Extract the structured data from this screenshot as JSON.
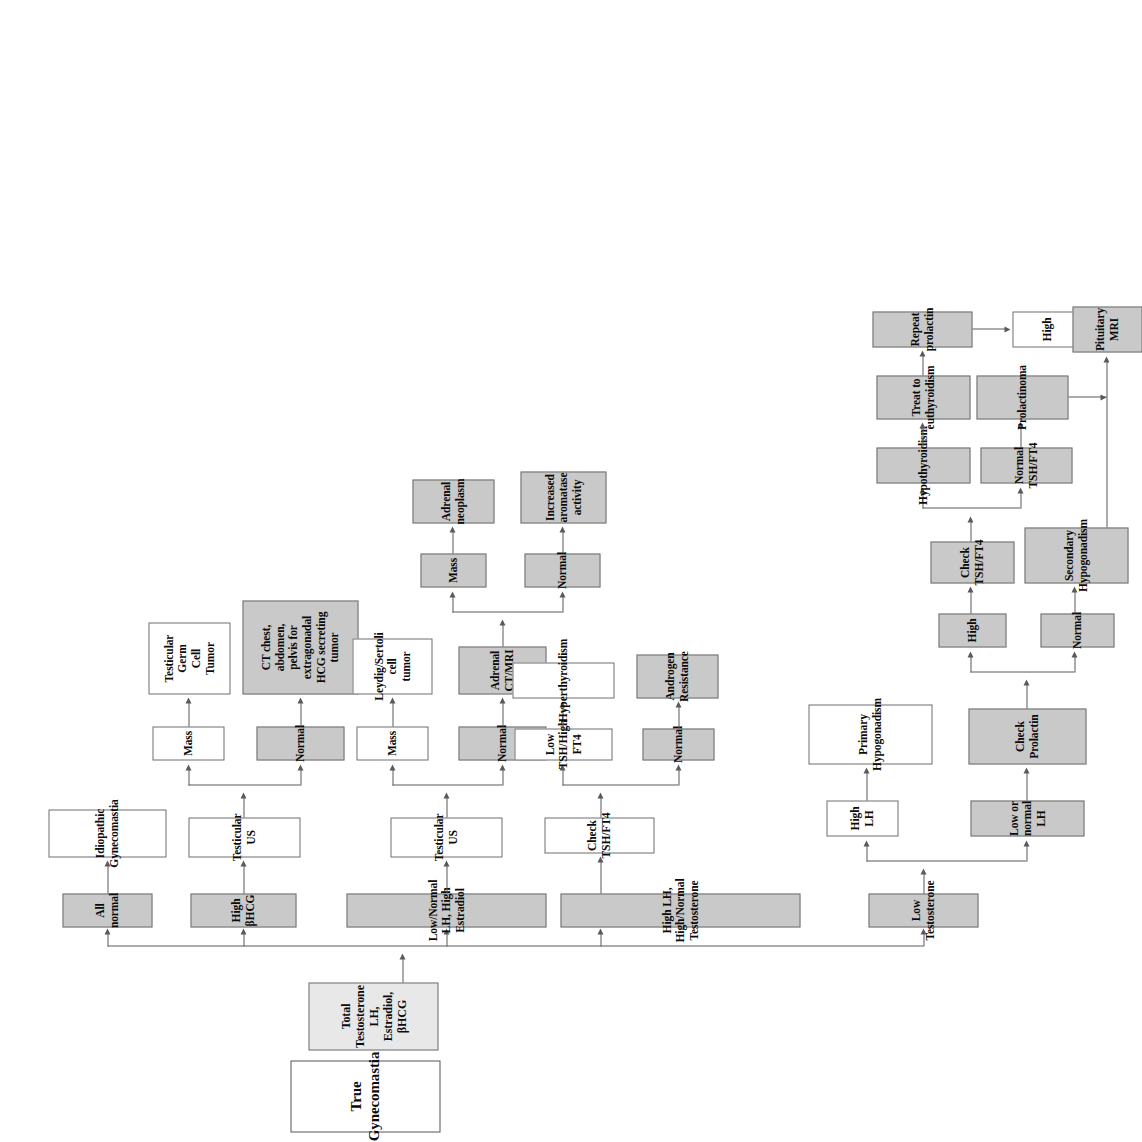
{
  "diagram": {
    "orientation": "rotated-90-ccw",
    "palette": {
      "gray_fill": "#c9c9c9",
      "light_gray_fill": "#e8e8e8",
      "white_fill": "#ffffff",
      "border": "#6e6e6e",
      "line": "#5a5a5a",
      "text": "#0b0b0b"
    },
    "nodes": {
      "root": "True Gynecomastia",
      "assay": "Total Testosterone\nLH, Estradiol, βHCG",
      "low_testosterone": "Low Testosterone",
      "high_lh_high_normal_t": "High LH, High/Normal Testosterone",
      "low_normal_lh_high_estradiol": "Low/Normal LH, High Estradiol",
      "high_bhcg": "High βHCG",
      "all_normal": "All normal",
      "high_lh": "High LH",
      "primary_hypogonadism": "Primary\nHypogonadism",
      "low_or_normal_lh": "Low or normal LH",
      "check_prolactin": "Check\nProlactin",
      "prolactin_high": "High",
      "prolactin_normal": "Normal",
      "check_tsh_ft4_prolactin": "Check\nTSH/FT4",
      "secondary_hypogonadism": "Secondary\nHypogonadism",
      "hypothyroidism": "Hypothyroidism",
      "normal_tsh_ft4": "Normal TSH/FT4",
      "treat_to_euthyroidism": "Treat to\neuthyroidism",
      "prolactinoma": "Prolactinoma",
      "repeat_prolactin": "Repeat prolactin",
      "repeat_high": "High",
      "pituitary_mri": "Pituitary\nMRI",
      "check_tsh_ft4_androgen": "Check TSH/FT4",
      "low_tsh_high_ft4": "Low TSH/High FT4",
      "hyperthyroidism": "Hyperthyroidism",
      "tsh_normal": "Normal",
      "androgen_resistance": "Androgen\nResistance",
      "testicular_us_estradiol": "Testicular US",
      "us_mass_estradiol": "Mass",
      "leydig_sertoli": "Leydig/Sertoli\ncell\ntumor",
      "us_normal_estradiol": "Normal",
      "adrenal_ct_mri": "Adrenal\nCT/MRI",
      "adrenal_mass": "Mass",
      "adrenal_neoplasm": "Adrenal\nneoplasm",
      "adrenal_normal": "Normal",
      "increased_aromatase": "Increased\naromatase\nactivity",
      "testicular_us_bhcg": "Testicular US",
      "us_mass_bhcg": "Mass",
      "testicular_germ_cell_tumor": "Testicular\nGerm\nCell\nTumor",
      "us_normal_bhcg": "Normal",
      "ct_extragonadal": "CT chest,\nabdomen,\npelvis for\nextragonadal\nHCG secreting\ntumor",
      "idiopathic_gynecomastia": "Idiopathic\nGynecomastia"
    }
  }
}
